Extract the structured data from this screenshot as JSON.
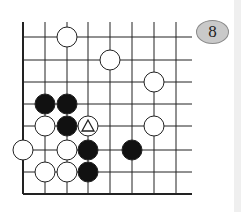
{
  "problem": {
    "number_label": "8",
    "badge_color": "#c9c9c9"
  },
  "board": {
    "columns_x": [
      23,
      45,
      67,
      88,
      110,
      132,
      154,
      176
    ],
    "rows_y": [
      37,
      60,
      82,
      104,
      126,
      150,
      172,
      194
    ],
    "line_top_y": 22,
    "line_right_x": 192,
    "stone_radius": 10,
    "stones": [
      {
        "color": "white",
        "col": 2,
        "row": 0
      },
      {
        "color": "white",
        "col": 4,
        "row": 1
      },
      {
        "color": "white",
        "col": 6,
        "row": 2
      },
      {
        "color": "black",
        "col": 1,
        "row": 3
      },
      {
        "color": "black",
        "col": 2,
        "row": 3
      },
      {
        "color": "white",
        "col": 1,
        "row": 4
      },
      {
        "color": "black",
        "col": 2,
        "row": 4
      },
      {
        "color": "white",
        "col": 3,
        "row": 4,
        "marker": "triangle"
      },
      {
        "color": "white",
        "col": 6,
        "row": 4
      },
      {
        "color": "white",
        "col": 0,
        "row": 5
      },
      {
        "color": "white",
        "col": 2,
        "row": 5
      },
      {
        "color": "black",
        "col": 3,
        "row": 5
      },
      {
        "color": "black",
        "col": 5,
        "row": 5
      },
      {
        "color": "white",
        "col": 1,
        "row": 6
      },
      {
        "color": "white",
        "col": 2,
        "row": 6
      },
      {
        "color": "black",
        "col": 3,
        "row": 6
      }
    ]
  }
}
